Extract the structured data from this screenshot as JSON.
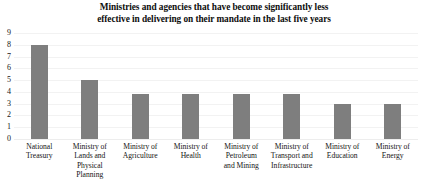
{
  "chart_data": {
    "type": "bar",
    "title": "Ministries and agencies that have become significantly less effective in delivering on their mandate in the last five years",
    "title_lines": [
      "Ministries and agencies that have become significantly less",
      "effective in delivering on their mandate in the last five years"
    ],
    "categories": [
      "National Treasury",
      "Ministry of Lands and Physical Planning",
      "Ministry of Agriculture",
      "Ministry of Health",
      "Ministry of Petroleum and Mining",
      "Ministry of Transport and Infrastructure",
      "Ministry of Education",
      "Ministry of Energy"
    ],
    "category_lines": [
      [
        "National",
        "Treasury"
      ],
      [
        "Ministry of",
        "Lands and",
        "Physical Planning"
      ],
      [
        "Ministry of",
        "Agriculture"
      ],
      [
        "Ministry of",
        "Health"
      ],
      [
        "Ministry of",
        "Petroleum",
        "and Mining"
      ],
      [
        "Ministry of",
        "Transport and",
        "Infrastructure"
      ],
      [
        "Ministry of",
        "Education"
      ],
      [
        "Ministry of",
        "Energy"
      ]
    ],
    "values": [
      8,
      5,
      3.8,
      3.8,
      3.8,
      3.8,
      3,
      3
    ],
    "xlabel": "",
    "ylabel": "",
    "ylim": [
      0,
      9
    ],
    "yticks": [
      9,
      8,
      7,
      6,
      5,
      4,
      3,
      2,
      1,
      0
    ],
    "grid": true,
    "legend": false,
    "bar_color": "#7e7e7e",
    "background_color": "#ffffff",
    "gridline_color": "#f2f2f2"
  }
}
